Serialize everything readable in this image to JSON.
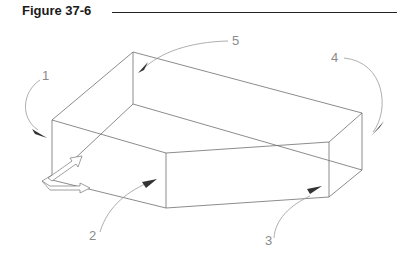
{
  "figure": {
    "title": "Figure 37-6",
    "callouts": [
      {
        "id": "1",
        "label": "1"
      },
      {
        "id": "2",
        "label": "2"
      },
      {
        "id": "3",
        "label": "3"
      },
      {
        "id": "4",
        "label": "4"
      },
      {
        "id": "5",
        "label": "5"
      }
    ],
    "colors": {
      "line": "#6e6e6e",
      "leader": "#9a9a9a",
      "arrowhead": "#333333",
      "title": "#1a1a1a",
      "label": "#8a8a8a"
    }
  }
}
